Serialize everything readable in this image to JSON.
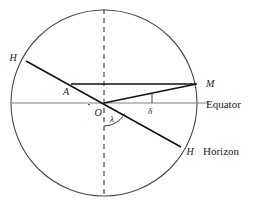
{
  "figure": {
    "background_color": "#ffffff",
    "stroke_color": "#1a1a1a",
    "axis_color": "#6e6e6e",
    "dash_color": "#585858"
  },
  "labels": {
    "h_upper": "H",
    "h_lower": "H",
    "point_a": "A",
    "point_o": "O",
    "point_m": "M",
    "angle_lambda": "λ",
    "angle_delta": "δ",
    "equator": "Equator",
    "horizon": "Horizon"
  },
  "geometry": {
    "circle": {
      "cx": 104,
      "cy": 103,
      "r": 93
    },
    "equator_line": {
      "x1": 11,
      "y1": 103,
      "x2": 208,
      "y2": 103
    },
    "meridian_dashed": {
      "x1": 104,
      "y1": 10,
      "x2": 104,
      "y2": 197
    },
    "horizon_line": {
      "x1": 26,
      "y1": 61,
      "x2": 181,
      "y2": 147
    },
    "chord_am": {
      "x1": 71,
      "y1": 84,
      "x2": 196,
      "y2": 84
    },
    "radius_om": {
      "x1": 104,
      "y1": 103,
      "x2": 196,
      "y2": 84
    },
    "delta_drop": {
      "x1": 152,
      "y1": 94,
      "x2": 152,
      "y2": 103
    },
    "lambda_arc": {
      "cx": 104,
      "cy": 103,
      "radius": 23,
      "from_deg": 90,
      "to_deg": 29
    }
  },
  "elements": {
    "icon_names": [
      "circle-outline-icon",
      "dashed-meridian-icon",
      "equator-axis-icon",
      "horizon-chord-icon",
      "declination-arc-icon"
    ]
  }
}
